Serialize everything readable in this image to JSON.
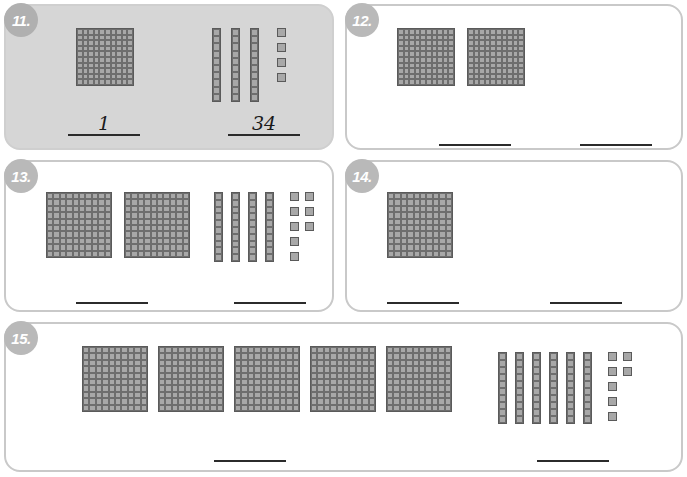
{
  "worksheet": {
    "background_color": "#ffffff",
    "block_fill_color": "#a8a8a8",
    "block_line_color": "#5a5a5a",
    "example_card_color": "#d6d6d6",
    "badge_color": "#b9b9b9",
    "answer_line_color": "#2b2b2b"
  },
  "problems": [
    {
      "number": "11.",
      "is_example": true,
      "hundreds": 1,
      "tens": 3,
      "ones": 4,
      "left_answer": "1",
      "right_answer": "34"
    },
    {
      "number": "12.",
      "is_example": false,
      "hundreds": 2,
      "tens": 1,
      "ones": 6,
      "left_answer": "",
      "right_answer": ""
    },
    {
      "number": "13.",
      "is_example": false,
      "hundreds": 2,
      "tens": 4,
      "ones": 8,
      "left_answer": "",
      "right_answer": ""
    },
    {
      "number": "14.",
      "is_example": false,
      "hundreds": 1,
      "tens": 7,
      "ones": 9,
      "left_answer": "",
      "right_answer": ""
    },
    {
      "number": "15.",
      "is_example": false,
      "hundreds": 5,
      "tens": 6,
      "ones": 7,
      "left_answer": "",
      "right_answer": ""
    }
  ],
  "layout": {
    "cards": [
      {
        "left": 4,
        "top": 4,
        "width": 330,
        "height": 146
      },
      {
        "left": 345,
        "top": 4,
        "width": 338,
        "height": 146
      },
      {
        "left": 4,
        "top": 160,
        "width": 330,
        "height": 152
      },
      {
        "left": 345,
        "top": 160,
        "width": 338,
        "height": 152
      },
      {
        "left": 4,
        "top": 322,
        "width": 679,
        "height": 150
      }
    ],
    "hundreds_area": [
      {
        "left": 70,
        "top": 22,
        "flat": 58,
        "gap": 0
      },
      {
        "left": 50,
        "top": 22,
        "flat": 58,
        "gap": 12
      },
      {
        "left": 40,
        "top": 30,
        "flat": 66,
        "gap": 12
      },
      {
        "left": 40,
        "top": 30,
        "flat": 66,
        "gap": 12
      },
      {
        "left": 76,
        "top": 22,
        "flat": 66,
        "gap": 10
      }
    ],
    "units_area": [
      {
        "left": 206,
        "top": 22,
        "rod_w": 9,
        "rod_h": 74,
        "rod_gap": 10,
        "unit": 9,
        "unit_gap": 6,
        "units_offset": 18
      },
      {
        "left": 555,
        "top": 22,
        "rod_w": 9,
        "rod_h": 60,
        "rod_gap": 10,
        "unit": 9,
        "unit_gap": 6,
        "units_offset": 16
      },
      {
        "left": 208,
        "top": 30,
        "rod_w": 9,
        "rod_h": 70,
        "rod_gap": 8,
        "unit": 9,
        "unit_gap": 6,
        "units_offset": 16
      },
      {
        "left": 500,
        "top": 30,
        "rod_w": 9,
        "rod_h": 70,
        "rod_gap": 8,
        "unit": 9,
        "unit_gap": 6,
        "units_offset": 16
      },
      {
        "left": 492,
        "top": 28,
        "rod_w": 9,
        "rod_h": 72,
        "rod_gap": 8,
        "unit": 9,
        "unit_gap": 6,
        "units_offset": 16
      }
    ],
    "answers": [
      {
        "left_x": 66,
        "right_x": 226,
        "y": 110,
        "w": 72
      },
      {
        "left_x": 437,
        "right_x": 578,
        "y": 120,
        "w": 72
      },
      {
        "left_x": 74,
        "right_x": 232,
        "y": 278,
        "w": 72
      },
      {
        "left_x": 385,
        "right_x": 548,
        "y": 278,
        "w": 72
      },
      {
        "left_x": 212,
        "right_x": 535,
        "y": 436,
        "w": 72
      }
    ]
  }
}
